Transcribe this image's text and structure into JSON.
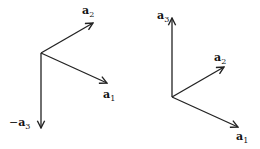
{
  "left_diagram": {
    "origin": [
      41,
      53
    ],
    "vectors": [
      {
        "name": "a2",
        "label": "a",
        "sub": "2",
        "prefix": "",
        "tip": [
          93,
          23
        ],
        "label_pos": [
          82,
          14
        ]
      },
      {
        "name": "a1",
        "label": "a",
        "sub": "1",
        "prefix": "",
        "tip": [
          107,
          83
        ],
        "label_pos": [
          103,
          98
        ]
      },
      {
        "name": "-a3",
        "label": "a",
        "sub": "3",
        "prefix": "−",
        "tip": [
          41,
          128
        ],
        "label_pos": [
          9,
          126
        ]
      }
    ]
  },
  "right_diagram": {
    "origin": [
      172,
      97
    ],
    "vectors": [
      {
        "name": "a3",
        "label": "a",
        "sub": "3",
        "prefix": "",
        "tip": [
          172,
          18
        ],
        "label_pos": [
          157,
          19
        ]
      },
      {
        "name": "a2",
        "label": "a",
        "sub": "2",
        "prefix": "",
        "tip": [
          224,
          67
        ],
        "label_pos": [
          214,
          61
        ]
      },
      {
        "name": "a1",
        "label": "a",
        "sub": "1",
        "prefix": "",
        "tip": [
          238,
          127
        ],
        "label_pos": [
          236,
          140
        ]
      }
    ]
  },
  "colors": {
    "stroke": "#222222",
    "text": "#111111",
    "background": "#ffffff"
  }
}
